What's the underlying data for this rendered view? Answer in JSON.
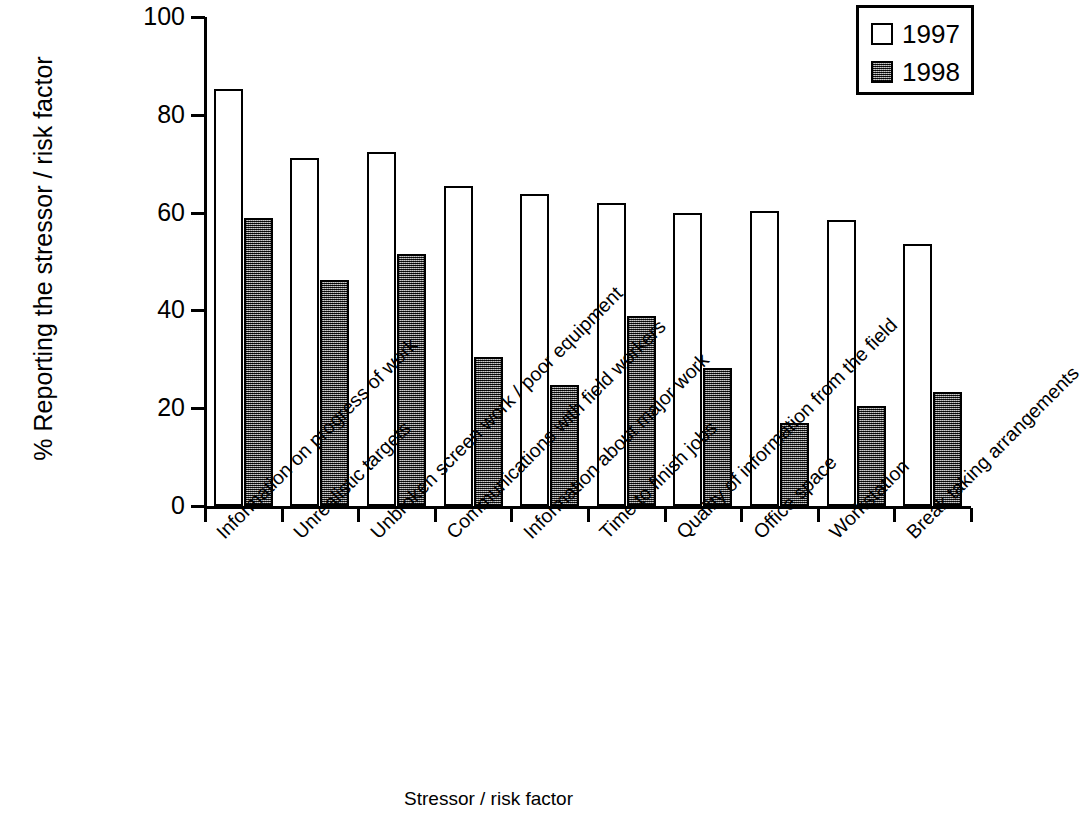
{
  "chart_data": {
    "type": "bar",
    "title": "",
    "xlabel": "Stressor / risk factor",
    "ylabel": "% Reporting the stressor / risk factor",
    "ylim": [
      0,
      100
    ],
    "yticks": [
      0,
      20,
      40,
      60,
      80,
      100
    ],
    "ytick_labels": [
      "0",
      "20",
      "40",
      "60",
      "80",
      "100"
    ],
    "grid": false,
    "legend_position": "top-right",
    "categories": [
      "Information on progress of work",
      "Unrealistic targets",
      "Unbroken screen work / poor equipment",
      "Communications with field workers",
      "Information about major work",
      "Time to finish jobs",
      "Quality of information from the field",
      "Office space",
      "Workstation",
      "Break taking arrangements"
    ],
    "series": [
      {
        "name": "1997",
        "color": "#ffffff",
        "values": [
          85.2,
          71.2,
          72.3,
          65.5,
          63.8,
          61.9,
          60.0,
          60.3,
          58.4,
          53.5
        ]
      },
      {
        "name": "1998",
        "color": "#4a4a4a",
        "values": [
          59.0,
          46.3,
          51.5,
          30.5,
          24.8,
          38.8,
          28.2,
          17.0,
          20.5,
          23.4
        ]
      }
    ]
  },
  "legend": {
    "entries": [
      {
        "label": "1997",
        "swatch": "open-square-swatch"
      },
      {
        "label": "1998",
        "swatch": "filled-square-swatch"
      }
    ]
  },
  "axes": {
    "y_title": "% Reporting the stressor / risk factor",
    "x_title": "Stressor / risk factor"
  }
}
